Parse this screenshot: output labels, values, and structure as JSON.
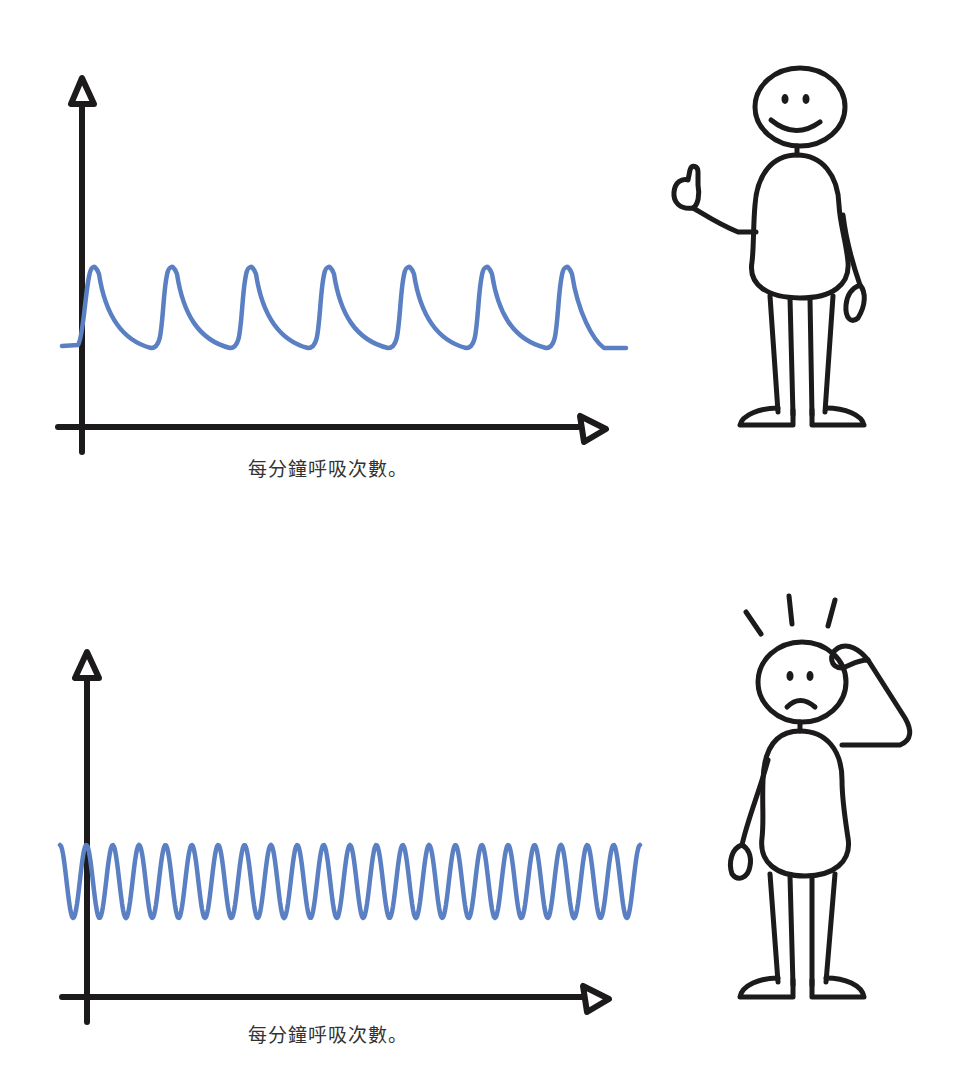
{
  "panels": [
    {
      "id": "normal-breathing",
      "caption": "每分鐘呼吸次數。",
      "mood": "happy",
      "character_gesture": "thumbs-up"
    },
    {
      "id": "rapid-breathing",
      "caption": "每分鐘呼吸次數。",
      "mood": "worried",
      "character_gesture": "scratching-head"
    }
  ],
  "colors": {
    "wave": "#5a7fc3",
    "ink": "#1c1a1a",
    "caption": "#333333",
    "background": "#ffffff"
  },
  "chart_data": [
    {
      "type": "line",
      "title": "",
      "xlabel": "每分鐘呼吸次數。",
      "ylabel": "",
      "description": "Slow, regular breathing waveform with sharp peaks and slow decay",
      "cycles_visible": 7,
      "peak_x_px": [
        95,
        173,
        252,
        330,
        410,
        488,
        568
      ],
      "peak_y_px": 268,
      "trough_y_px": 348,
      "grid": false,
      "legend": null
    },
    {
      "type": "line",
      "title": "",
      "xlabel": "每分鐘呼吸次數。",
      "ylabel": "",
      "description": "Rapid, shallow sinusoidal breathing waveform",
      "cycles_visible": 22,
      "peak_y_px": 845,
      "trough_y_px": 918,
      "x_start_px": 60,
      "x_end_px": 640,
      "grid": false,
      "legend": null
    }
  ]
}
